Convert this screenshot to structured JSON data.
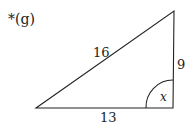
{
  "problem_label": "*(g)",
  "triangle": {
    "hypotenuse_label": "16",
    "vertical_side_label": "9",
    "base_label": "13",
    "angle_label": "x",
    "stroke_color": "#222222"
  }
}
